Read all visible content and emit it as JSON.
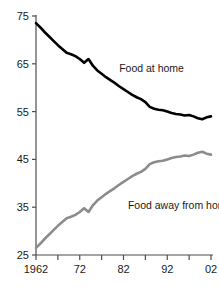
{
  "chart_data": {
    "type": "line",
    "title": "",
    "xlabel": "",
    "ylabel": "",
    "xlim": [
      1962,
      2002
    ],
    "ylim": [
      25,
      75
    ],
    "grid": false,
    "legend_position": "inline-annotation",
    "x_ticks": [
      1962,
      1967,
      1972,
      1977,
      1982,
      1987,
      1992,
      1997,
      2002
    ],
    "x_tick_labels": [
      "1962",
      "",
      "72",
      "",
      "82",
      "",
      "92",
      "",
      "02"
    ],
    "y_ticks": [
      25,
      35,
      45,
      55,
      65,
      75
    ],
    "y_tick_labels": [
      "25",
      "35",
      "45",
      "55",
      "65",
      "75"
    ],
    "x": [
      1962,
      1963,
      1964,
      1965,
      1966,
      1967,
      1968,
      1969,
      1970,
      1971,
      1972,
      1973,
      1974,
      1975,
      1976,
      1977,
      1978,
      1979,
      1980,
      1981,
      1982,
      1983,
      1984,
      1985,
      1986,
      1987,
      1988,
      1989,
      1990,
      1991,
      1992,
      1993,
      1994,
      1995,
      1996,
      1997,
      1998,
      1999,
      2000,
      2001,
      2002
    ],
    "series": [
      {
        "name": "Food at home",
        "color": "#000000",
        "label": "Food at home",
        "label_x": 1981,
        "label_y": 63.2,
        "values": [
          73.5,
          72.6,
          71.6,
          70.7,
          69.8,
          68.9,
          68.1,
          67.3,
          67.0,
          66.6,
          66.0,
          65.2,
          66.0,
          64.6,
          63.6,
          62.9,
          62.2,
          61.6,
          61.0,
          60.3,
          59.7,
          59.1,
          58.5,
          58.0,
          57.6,
          57.0,
          56.0,
          55.6,
          55.4,
          55.3,
          55.0,
          54.7,
          54.5,
          54.4,
          54.2,
          54.3,
          54.0,
          53.6,
          53.4,
          53.8,
          54.0
        ]
      },
      {
        "name": "Food away from home",
        "color": "#8c8c8c",
        "label": "Food away from home",
        "label_x": 1983,
        "label_y": 34.6,
        "values": [
          26.5,
          27.4,
          28.4,
          29.3,
          30.2,
          31.1,
          31.9,
          32.7,
          33.0,
          33.4,
          34.0,
          34.8,
          34.0,
          35.4,
          36.4,
          37.1,
          37.8,
          38.4,
          39.0,
          39.7,
          40.3,
          40.9,
          41.5,
          42.0,
          42.4,
          43.0,
          44.0,
          44.4,
          44.6,
          44.7,
          45.0,
          45.3,
          45.5,
          45.6,
          45.8,
          45.7,
          46.0,
          46.4,
          46.6,
          46.2,
          46.0
        ]
      }
    ]
  },
  "layout": {
    "plot_left": 36,
    "plot_right": 211,
    "plot_top": 16,
    "plot_bottom": 255
  }
}
